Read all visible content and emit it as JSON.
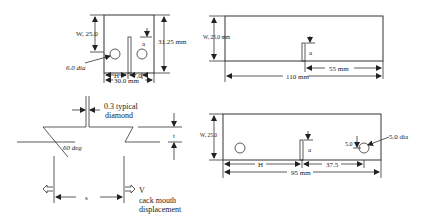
{
  "figure_1_compact_specimen": {
    "width_label": "W, 25.0",
    "height_label": "31.25 mm",
    "hole_label": "6.0 dia",
    "h_label": "H",
    "offset_label": "7.0",
    "overall_width_label": "30.0 mm",
    "crack_label": "a"
  },
  "figure_2_beam_specimen": {
    "width_label": "W, 25.0 mm",
    "crack_label": "a",
    "half_span_label": "55 mm",
    "length_label": "110 mm"
  },
  "figure_3_notch_detail": {
    "tip_label": "0.3 typical",
    "tip_label_line2": "diamond",
    "angle_label": "60 deg",
    "thickness_label": "t",
    "spacing_label": "s",
    "v_label": "V",
    "cmod_line1": "cack mouth",
    "cmod_line2": "displacement"
  },
  "figure_4_wedge_specimen": {
    "width_label": "W, 25.0",
    "crack_label": "a",
    "hole_offset_label": "5.0",
    "hole_label": "5.0 dia",
    "h_label": "H",
    "pin_span_label": "37.5",
    "length_label": "95 mm"
  }
}
